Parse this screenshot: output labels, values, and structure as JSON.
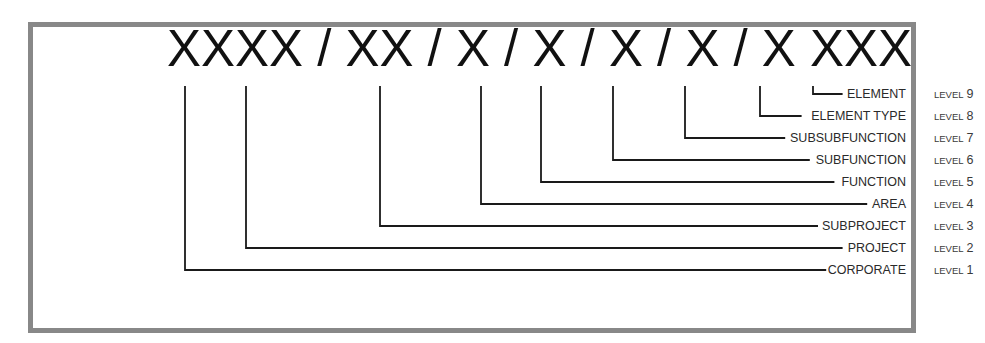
{
  "diagram": {
    "code": "XXXX / XX / X / X / X / X / X XXX",
    "frame_color": "#888888",
    "line_color": "#1a1a1a",
    "levels": [
      {
        "label": "ELEMENT",
        "level_word": "LEVEL",
        "level_num": "9",
        "x": 813,
        "y": 98
      },
      {
        "label": "ELEMENT TYPE",
        "level_word": "LEVEL",
        "level_num": "8",
        "x": 760,
        "y": 120
      },
      {
        "label": "SUBSUBFUNCTION",
        "level_word": "LEVEL",
        "level_num": "7",
        "x": 685,
        "y": 142
      },
      {
        "label": "SUBFUNCTION",
        "level_word": "LEVEL",
        "level_num": "6",
        "x": 613,
        "y": 164
      },
      {
        "label": "FUNCTION",
        "level_word": "LEVEL",
        "level_num": "5",
        "x": 541,
        "y": 186
      },
      {
        "label": "AREA",
        "level_word": "LEVEL",
        "level_num": "4",
        "x": 481,
        "y": 208
      },
      {
        "label": "SUBPROJECT",
        "level_word": "LEVEL",
        "level_num": "3",
        "x": 380,
        "y": 230
      },
      {
        "label": "PROJECT",
        "level_word": "LEVEL",
        "level_num": "2",
        "x": 246,
        "y": 252
      },
      {
        "label": "CORPORATE",
        "level_word": "LEVEL",
        "level_num": "1",
        "x": 185,
        "y": 274
      }
    ]
  }
}
